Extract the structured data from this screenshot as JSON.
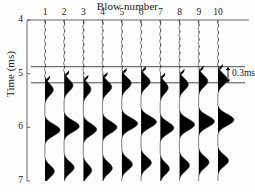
{
  "chart_data": {
    "type": "line",
    "title": "Blow number",
    "xlabel": "Blow number",
    "ylabel": "Time (ms)",
    "orientation": "vertical-traces",
    "x_tick_labels": [
      "1",
      "2",
      "3",
      "4",
      "5",
      "6",
      "7",
      "8",
      "9",
      "10"
    ],
    "x_values": [
      1,
      2,
      3,
      4,
      5,
      6,
      7,
      8,
      9,
      10
    ],
    "xlim": [
      0.5,
      10.5
    ],
    "y_tick_labels": [
      "4",
      "5",
      "6",
      "7"
    ],
    "y_values": [
      4,
      5,
      6,
      7
    ],
    "ylim": [
      4,
      7
    ],
    "y_axis_direction": "increasing-downward",
    "grid": false,
    "legend": null,
    "fill_color": "#000000",
    "trace_color": "#222222",
    "axis_color": "#555555",
    "reference_lines": [
      {
        "time": 4.87,
        "label": ""
      },
      {
        "time": 5.17,
        "label": ""
      }
    ],
    "annotations": [
      {
        "text": "0.3ms",
        "time_span": [
          4.87,
          5.17
        ],
        "near_trace": 10,
        "marker": "double-arrow"
      }
    ],
    "first_break_times": [
      5.12,
      5.02,
      5.1,
      5.05,
      4.97,
      4.94,
      5.06,
      4.99,
      4.93,
      4.9
    ],
    "series": [
      {
        "name": "Blow 1",
        "first_break": 5.12,
        "peak_times": [
          5.3,
          6.05,
          6.82
        ],
        "peak_amplitudes": [
          0.55,
          1.0,
          0.62
        ]
      },
      {
        "name": "Blow 2",
        "first_break": 5.02,
        "peak_times": [
          5.22,
          5.98,
          6.75
        ],
        "peak_amplitudes": [
          0.58,
          1.0,
          0.66
        ]
      },
      {
        "name": "Blow 3",
        "first_break": 5.1,
        "peak_times": [
          5.29,
          6.04,
          6.8
        ],
        "peak_amplitudes": [
          0.5,
          0.88,
          0.55
        ]
      },
      {
        "name": "Blow 4",
        "first_break": 5.05,
        "peak_times": [
          5.25,
          6.0,
          6.76
        ],
        "peak_amplitudes": [
          0.6,
          0.95,
          0.64
        ]
      },
      {
        "name": "Blow 5",
        "first_break": 4.97,
        "peak_times": [
          5.18,
          5.93,
          6.69
        ],
        "peak_amplitudes": [
          0.62,
          1.05,
          0.7
        ]
      },
      {
        "name": "Blow 6",
        "first_break": 4.94,
        "peak_times": [
          5.15,
          5.9,
          6.66
        ],
        "peak_amplitudes": [
          0.6,
          1.02,
          0.68
        ]
      },
      {
        "name": "Blow 7",
        "first_break": 5.06,
        "peak_times": [
          5.26,
          6.01,
          6.77
        ],
        "peak_amplitudes": [
          0.52,
          0.9,
          0.6
        ]
      },
      {
        "name": "Blow 8",
        "first_break": 4.99,
        "peak_times": [
          5.2,
          5.95,
          6.71
        ],
        "peak_amplitudes": [
          0.58,
          1.0,
          0.66
        ]
      },
      {
        "name": "Blow 9",
        "first_break": 4.93,
        "peak_times": [
          5.14,
          5.89,
          6.65
        ],
        "peak_amplitudes": [
          0.6,
          1.04,
          0.68
        ]
      },
      {
        "name": "Blow 10",
        "first_break": 4.9,
        "peak_times": [
          5.11,
          5.86,
          6.62
        ],
        "peak_amplitudes": [
          0.62,
          1.06,
          0.7
        ]
      }
    ]
  },
  "axes": {
    "top_axis_label": "Blow number",
    "left_axis_label": "Time (ms)"
  }
}
